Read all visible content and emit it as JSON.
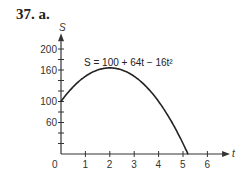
{
  "problem_label": "37. a.",
  "chart_data": {
    "type": "line",
    "title": "",
    "equation": "S = 100 + 64t − 16t²",
    "xlabel": "t",
    "ylabel": "S",
    "xlim": [
      0,
      6
    ],
    "ylim": [
      0,
      200
    ],
    "x_ticks": [
      "0",
      "1",
      "2",
      "3",
      "4",
      "5",
      "6"
    ],
    "y_ticks": [
      "60",
      "100",
      "160",
      "200"
    ],
    "grid": false,
    "series": [
      {
        "name": "S = 100 + 64t − 16t²",
        "x": [
          0,
          0.5,
          1,
          1.5,
          2,
          2.5,
          3,
          3.5,
          4,
          4.5,
          5,
          5.22
        ],
        "values": [
          100,
          128,
          148,
          160,
          164,
          160,
          148,
          128,
          100,
          64,
          20,
          0
        ]
      }
    ]
  }
}
